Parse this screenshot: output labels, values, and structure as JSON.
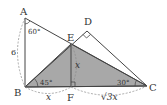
{
  "figure": {
    "points": {
      "A": {
        "label": "A",
        "x": 25,
        "y": 18
      },
      "B": {
        "label": "B",
        "x": 25,
        "y": 87
      },
      "C": {
        "label": "C",
        "x": 147,
        "y": 86
      },
      "D": {
        "label": "D",
        "x": 87,
        "y": 31
      },
      "E": {
        "label": "E",
        "x": 71,
        "y": 44
      },
      "F": {
        "label": "F",
        "x": 71,
        "y": 87
      }
    },
    "angles": {
      "A": "60°",
      "B": "45°",
      "C": "30°"
    },
    "lengths": {
      "AB": "6",
      "EF": "x",
      "BF": "x",
      "FC": "√3x"
    },
    "colors": {
      "line": "#444444",
      "shade": "#a8a8a8",
      "dashed": "#888888",
      "background": "#ffffff"
    }
  }
}
